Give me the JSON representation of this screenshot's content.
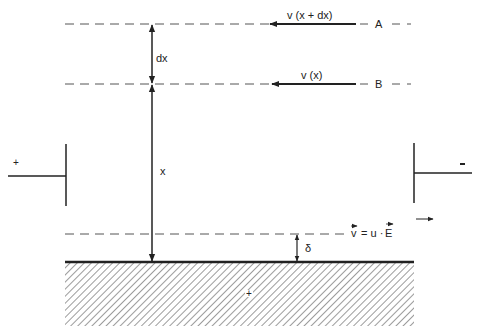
{
  "diagram": {
    "type": "electro-osmotic flow near surface",
    "colors": {
      "ink": "#222222",
      "dash": "#555555",
      "hatch": "#666666",
      "background": "#ffffff"
    },
    "labels": {
      "line_a": "A",
      "line_b": "B",
      "velocity_a": "v (x + dx)",
      "velocity_b": "v (x)",
      "dx": "dx",
      "x": "x",
      "delta": "δ",
      "velocity_formula_v": "v",
      "velocity_formula_rest": " = u · ",
      "velocity_formula_e": "E",
      "electrode_left_sign": "+",
      "electrode_right_sign": "-",
      "surface_sign": "+"
    }
  }
}
